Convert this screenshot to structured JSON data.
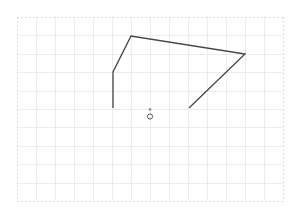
{
  "canvas": {
    "width": 298,
    "height": 217,
    "background": "#ffffff"
  },
  "grid": {
    "x0": 17,
    "y0": 17,
    "x1": 283,
    "y1": 201,
    "cols": 14,
    "rows": 10,
    "line_color": "#ececec",
    "border_color": "#dddddd"
  },
  "shapes": {
    "polyline": {
      "points": [
        [
          113,
          108
        ],
        [
          113,
          72
        ],
        [
          131,
          36
        ],
        [
          245,
          54
        ],
        [
          189,
          108
        ]
      ],
      "stroke": "#444444",
      "stroke_width": 1.3
    },
    "dot": {
      "cx": 150,
      "cy": 109.5,
      "r": 1.4,
      "fill": "#999999"
    },
    "circle": {
      "cx": 150,
      "cy": 116.5,
      "r": 2.6,
      "stroke": "#555555",
      "stroke_width": 1
    }
  }
}
